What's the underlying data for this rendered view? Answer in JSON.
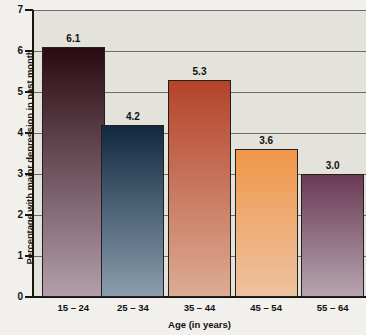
{
  "chart_data": {
    "type": "bar",
    "title": "",
    "xlabel": "Age (in years)",
    "ylabel": "Percentage with major depression in past month",
    "categories": [
      "15 – 24",
      "25 – 34",
      "35 – 44",
      "45 – 54",
      "55 – 64"
    ],
    "values": [
      6.1,
      4.2,
      5.3,
      3.6,
      3.0
    ],
    "value_labels": [
      "6.1",
      "4.2",
      "5.3",
      "3.6",
      "3.0"
    ],
    "ylim": [
      0,
      7
    ],
    "ytick_labels": [
      "0",
      "1",
      "2",
      "3",
      "4",
      "5",
      "6",
      "7"
    ],
    "grid": "horizontal",
    "legend": "none",
    "bar_colors": [
      {
        "top": "#2b0a12",
        "bottom": "#b39eab"
      },
      {
        "top": "#112a41",
        "bottom": "#8b9dae"
      },
      {
        "top": "#b4432a",
        "bottom": "#dcac93"
      },
      {
        "top": "#ef9749",
        "bottom": "#eec2a1"
      },
      {
        "top": "#6b3a55",
        "bottom": "#b6a5af"
      }
    ],
    "plot_background": "#e3e3dc",
    "page_background": "#f2f0ed",
    "axis_color": "#16160f",
    "gridline_color": "#6d6d67"
  }
}
